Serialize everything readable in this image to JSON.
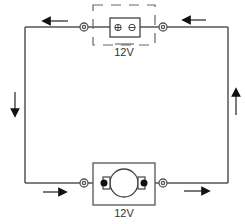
{
  "diagram": {
    "type": "circuit",
    "components": {
      "battery": {
        "label": "12V",
        "positive_symbol": "⊕",
        "negative_symbol": "⊖"
      },
      "motor": {
        "label": "12V"
      }
    },
    "current_arrows": [
      {
        "position": "top-left",
        "direction": "left"
      },
      {
        "position": "top-right",
        "direction": "left"
      },
      {
        "position": "left-side",
        "direction": "down"
      },
      {
        "position": "right-side",
        "direction": "up"
      },
      {
        "position": "bottom-left",
        "direction": "right"
      },
      {
        "position": "bottom-right",
        "direction": "right"
      }
    ],
    "colors": {
      "wire": "#555555",
      "stroke": "#444444",
      "background": "#ffffff"
    }
  }
}
